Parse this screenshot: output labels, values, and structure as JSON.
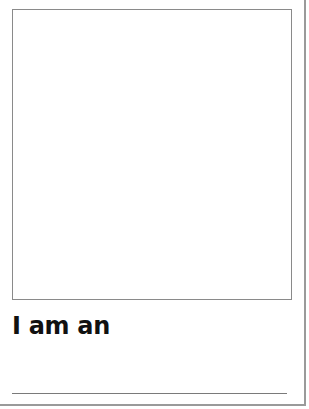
{
  "worksheet": {
    "drawing_area": {
      "label": ""
    },
    "prompt_text": "I am an",
    "answer_line": {
      "value": ""
    }
  },
  "colors": {
    "border": "#9a9a9a",
    "box_border": "#8a8a8a",
    "text": "#111111",
    "line": "#7a7a7a",
    "background": "#ffffff"
  }
}
